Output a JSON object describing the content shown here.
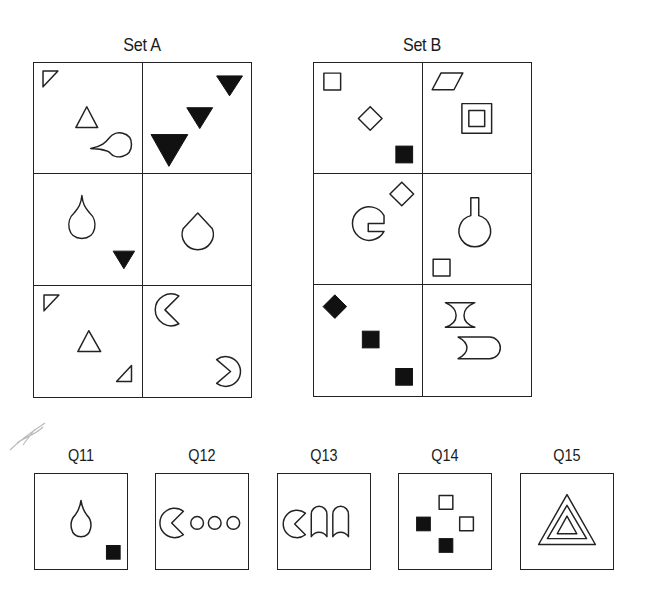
{
  "set_a": {
    "title": "Set A",
    "cells": [
      {
        "row": 1,
        "col": 1,
        "shapes": [
          "small-outline-right-triangle-corner",
          "outline-triangle",
          "outline-teardrop-pointing-left"
        ]
      },
      {
        "row": 1,
        "col": 2,
        "shapes": [
          "small-black-inverted-triangle",
          "medium-black-inverted-triangle",
          "large-black-inverted-triangle"
        ]
      },
      {
        "row": 2,
        "col": 1,
        "shapes": [
          "outline-teardrop-pointing-up",
          "black-inverted-triangle"
        ]
      },
      {
        "row": 2,
        "col": 2,
        "shapes": [
          "outline-drop-cone"
        ]
      },
      {
        "row": 3,
        "col": 1,
        "shapes": [
          "small-outline-right-triangle-corner",
          "outline-triangle",
          "small-outline-right-triangle-bottom-right"
        ]
      },
      {
        "row": 3,
        "col": 2,
        "shapes": [
          "outline-pacman-right",
          "outline-pacman-left"
        ]
      }
    ]
  },
  "set_b": {
    "title": "Set B",
    "cells": [
      {
        "row": 1,
        "col": 1,
        "shapes": [
          "outline-square",
          "outline-diamond",
          "black-square"
        ]
      },
      {
        "row": 1,
        "col": 2,
        "shapes": [
          "outline-parallelogram",
          "nested-squares"
        ]
      },
      {
        "row": 2,
        "col": 1,
        "shapes": [
          "outline-diamond",
          "outline-square-notch-circle"
        ]
      },
      {
        "row": 2,
        "col": 2,
        "shapes": [
          "outline-flask",
          "outline-square"
        ]
      },
      {
        "row": 3,
        "col": 1,
        "shapes": [
          "black-diamond",
          "black-square",
          "black-square"
        ]
      },
      {
        "row": 3,
        "col": 2,
        "shapes": [
          "outline-hourglass-bar",
          "outline-bullet-shape"
        ]
      }
    ]
  },
  "questions": [
    {
      "label": "Q11",
      "shapes": [
        "outline-teardrop-pointing-up",
        "black-square"
      ]
    },
    {
      "label": "Q12",
      "shapes": [
        "outline-pacman-right",
        "outline-circle",
        "outline-circle",
        "outline-circle"
      ]
    },
    {
      "label": "Q13",
      "shapes": [
        "outline-pacman-right",
        "outline-arch",
        "outline-arch"
      ]
    },
    {
      "label": "Q14",
      "shapes": [
        "outline-square",
        "black-square",
        "outline-square",
        "black-square"
      ]
    },
    {
      "label": "Q15",
      "shapes": [
        "nested-triangles"
      ]
    }
  ],
  "colors": {
    "ink": "#222222",
    "fill_black": "#111111",
    "background": "#ffffff"
  }
}
